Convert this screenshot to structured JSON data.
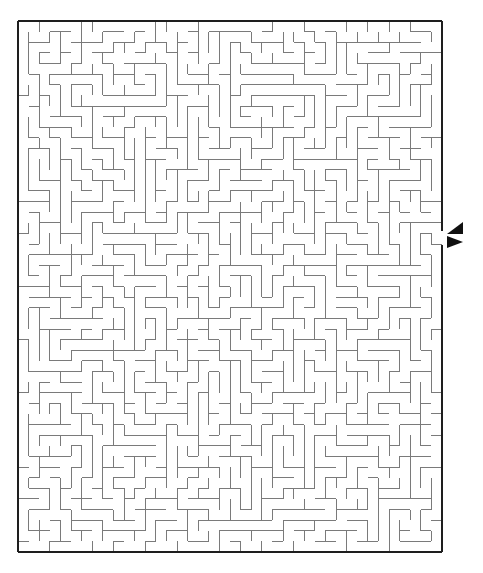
{
  "puzzle": {
    "type": "maze",
    "grid": {
      "cols": 40,
      "rows": 50
    },
    "frame": {
      "x": 18,
      "y": 21,
      "width": 424,
      "height": 531
    },
    "exit": {
      "side": "right",
      "row": 20,
      "gap_y1": 231,
      "gap_y2": 245
    },
    "markers": [
      {
        "name": "arrow-in",
        "direction": "left",
        "points": "463,222 463,234 447,234"
      },
      {
        "name": "arrow-out",
        "direction": "right",
        "points": "447,236 447,248 463,242"
      }
    ],
    "colors": {
      "wall": "#7a7a7a",
      "border": "#1e1e1e",
      "arrow": "#111111",
      "background": "#ffffff"
    },
    "seed": 73
  }
}
